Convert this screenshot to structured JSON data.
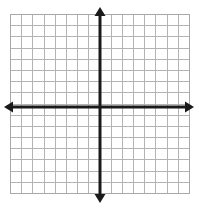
{
  "figure": {
    "kind": "coordinate-grid"
  },
  "chart_data": {
    "type": "scatter",
    "title": "",
    "subtitle": "",
    "xlabel": "",
    "ylabel": "",
    "grid": true,
    "legend": false,
    "legend_position": "none",
    "xlim": [
      -8,
      8
    ],
    "ylim": [
      -8,
      8
    ],
    "x_tick_labels": [],
    "y_tick_labels": [],
    "x_major_step": 1,
    "y_major_step": 1,
    "columns": 16,
    "rows": 16,
    "series": [],
    "annotations": [],
    "axes": {
      "x_axis": {
        "name": "x-axis",
        "visible": true,
        "arrow_start": true,
        "arrow_end": true,
        "color": "#1a1a1a"
      },
      "y_axis": {
        "name": "y-axis",
        "visible": true,
        "arrow_start": true,
        "arrow_end": true,
        "color": "#1a1a1a"
      }
    }
  },
  "geometry": {
    "grid_left": 10,
    "grid_top": 14,
    "grid_right": 189,
    "grid_bottom": 193,
    "cell_size": 11.1875,
    "origin_x": 100,
    "origin_y": 107,
    "x_arrow_left_tip": 4,
    "x_arrow_right_tip": 194,
    "y_arrow_top_tip": 7,
    "y_arrow_bottom_tip": 203
  },
  "colors": {
    "background": "#ffffff",
    "grid_line": "#b3b3b3",
    "grid_border": "#a8a8a8",
    "axis": "#1a1a1a"
  }
}
